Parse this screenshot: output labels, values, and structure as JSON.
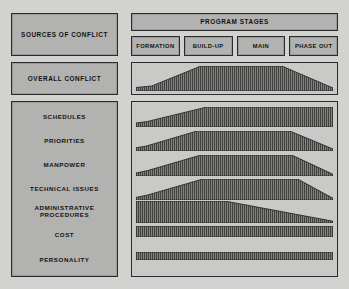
{
  "header": {
    "sources_title": "SOURCES OF CONFLICT",
    "stages_title": "PROGRAM STAGES"
  },
  "stages": [
    {
      "label": "FORMATION"
    },
    {
      "label": "BUILD-UP"
    },
    {
      "label": "MAIN"
    },
    {
      "label": "PHASE OUT"
    }
  ],
  "overall": {
    "label": "OVERALL CONFLICT"
  },
  "sources": [
    {
      "label": "SCHEDULES"
    },
    {
      "label": "PRIORITIES"
    },
    {
      "label": "MANPOWER"
    },
    {
      "label": "TECHNICAL ISSUES"
    },
    {
      "label": "ADMINISTRATIVE PROCEDURES"
    },
    {
      "label": "COST"
    },
    {
      "label": "PERSONALITY"
    }
  ],
  "colors": {
    "page_background": "#d2d2d0",
    "panel_fill": "#b2b2b0",
    "plot_fill": "#c9c9c7",
    "border": "#2b2b2b",
    "hatch_ink": "#3a3a3a",
    "text": "#121212"
  },
  "chart_data": {
    "type": "area",
    "title": "SOURCES OF CONFLICT",
    "xlabel": "PROGRAM STAGES",
    "ylabel": "",
    "x": [
      0,
      25,
      50,
      75,
      100
    ],
    "xtick_labels": [
      "FORMATION",
      "BUILD-UP",
      "MAIN",
      "PHASE OUT"
    ],
    "ylim": [
      0,
      100
    ],
    "grid": false,
    "legend": "none",
    "note": "Relative conflict intensity (% of band height) across the four program stages.",
    "overall_series": {
      "name": "OVERALL CONFLICT",
      "x": [
        0,
        8,
        33,
        74,
        100
      ],
      "values": [
        14,
        20,
        100,
        100,
        12
      ]
    },
    "series": [
      {
        "name": "SCHEDULES",
        "x": [
          0,
          6,
          36,
          100
        ],
        "values": [
          20,
          28,
          100,
          100
        ]
      },
      {
        "name": "PRIORITIES",
        "x": [
          0,
          5,
          31,
          78,
          100
        ],
        "values": [
          16,
          24,
          100,
          100,
          10
        ]
      },
      {
        "name": "MANPOWER",
        "x": [
          0,
          6,
          33,
          79,
          100
        ],
        "values": [
          14,
          26,
          100,
          100,
          8
        ]
      },
      {
        "name": "TECHNICAL ISSUES",
        "x": [
          0,
          6,
          34,
          82,
          100
        ],
        "values": [
          12,
          24,
          100,
          100,
          8
        ]
      },
      {
        "name": "ADMINISTRATIVE PROCEDURES",
        "x": [
          0,
          45,
          100
        ],
        "values": [
          100,
          100,
          8
        ]
      },
      {
        "name": "COST",
        "x": [
          0,
          100
        ],
        "values": [
          100,
          100
        ]
      },
      {
        "name": "PERSONALITY",
        "x": [
          0,
          100
        ],
        "values": [
          100,
          100
        ]
      }
    ]
  }
}
